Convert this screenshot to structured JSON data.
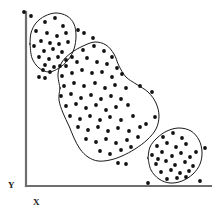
{
  "figure": {
    "title": "",
    "background_color": "#ffffff",
    "width": 217,
    "height": 213
  },
  "axes": {
    "x_label": "X",
    "y_label": "Y",
    "axis_color": "#6e6e6e",
    "origin_x": 26,
    "origin_y": 186,
    "x_axis_end": 211,
    "y_axis_top": 12
  },
  "style": {
    "point_color": "#111111",
    "point_radius": 1.9,
    "contour_color": "#1a1a1a",
    "contour_width": 1.0
  },
  "chart_data": {
    "type": "scatter",
    "title": "",
    "xlabel": "X",
    "ylabel": "Y",
    "xlim": [
      26,
      211
    ],
    "ylim": [
      12,
      186
    ],
    "grid": false,
    "legend": "none",
    "annotation": "Three point clusters enclosed by hand-drawn contours",
    "cluster_count": 3,
    "series": [
      {
        "name": "cluster-top-left",
        "shape": "circular-blob",
        "point_count": 25,
        "points": [
          [
            31,
            16
          ],
          [
            45,
            22
          ],
          [
            55,
            18
          ],
          [
            63,
            26
          ],
          [
            36,
            31
          ],
          [
            47,
            33
          ],
          [
            57,
            36
          ],
          [
            66,
            33
          ],
          [
            41,
            41
          ],
          [
            50,
            43
          ],
          [
            59,
            44
          ],
          [
            68,
            42
          ],
          [
            34,
            46
          ],
          [
            44,
            51
          ],
          [
            53,
            49
          ],
          [
            62,
            52
          ],
          [
            39,
            57
          ],
          [
            49,
            59
          ],
          [
            58,
            57
          ],
          [
            66,
            60
          ],
          [
            45,
            65
          ],
          [
            54,
            67
          ],
          [
            50,
            72
          ],
          [
            43,
            70
          ],
          [
            60,
            66
          ]
        ],
        "contour": [
          [
            30,
            44
          ],
          [
            31,
            33
          ],
          [
            36,
            23
          ],
          [
            45,
            16
          ],
          [
            56,
            13
          ],
          [
            67,
            16
          ],
          [
            74,
            24
          ],
          [
            76,
            36
          ],
          [
            74,
            49
          ],
          [
            68,
            60
          ],
          [
            59,
            68
          ],
          [
            49,
            72
          ],
          [
            39,
            68
          ],
          [
            32,
            58
          ],
          [
            30,
            44
          ]
        ],
        "outliers": [
          [
            24,
            12
          ],
          [
            78,
            30
          ],
          [
            84,
            33
          ],
          [
            39,
            77
          ],
          [
            45,
            78
          ]
        ]
      },
      {
        "name": "cluster-center",
        "shape": "peanut-kidney",
        "point_count": 63,
        "points": [
          [
            72,
            57
          ],
          [
            83,
            50
          ],
          [
            94,
            46
          ],
          [
            104,
            51
          ],
          [
            112,
            57
          ],
          [
            66,
            66
          ],
          [
            77,
            62
          ],
          [
            87,
            58
          ],
          [
            97,
            62
          ],
          [
            107,
            64
          ],
          [
            117,
            68
          ],
          [
            62,
            76
          ],
          [
            72,
            73
          ],
          [
            82,
            70
          ],
          [
            92,
            73
          ],
          [
            102,
            72
          ],
          [
            112,
            77
          ],
          [
            122,
            74
          ],
          [
            64,
            86
          ],
          [
            74,
            83
          ],
          [
            84,
            86
          ],
          [
            95,
            83
          ],
          [
            105,
            88
          ],
          [
            115,
            85
          ],
          [
            126,
            88
          ],
          [
            61,
            96
          ],
          [
            71,
            94
          ],
          [
            81,
            98
          ],
          [
            91,
            95
          ],
          [
            101,
            99
          ],
          [
            111,
            96
          ],
          [
            121,
            99
          ],
          [
            66,
            106
          ],
          [
            76,
            104
          ],
          [
            86,
            108
          ],
          [
            96,
            105
          ],
          [
            106,
            110
          ],
          [
            116,
            107
          ],
          [
            128,
            105
          ],
          [
            70,
            116
          ],
          [
            80,
            119
          ],
          [
            90,
            116
          ],
          [
            100,
            120
          ],
          [
            110,
            117
          ],
          [
            121,
            120
          ],
          [
            133,
            116
          ],
          [
            78,
            127
          ],
          [
            88,
            130
          ],
          [
            98,
            127
          ],
          [
            108,
            131
          ],
          [
            118,
            128
          ],
          [
            129,
            131
          ],
          [
            140,
            127
          ],
          [
            86,
            139
          ],
          [
            96,
            142
          ],
          [
            106,
            139
          ],
          [
            116,
            143
          ],
          [
            127,
            140
          ],
          [
            138,
            137
          ],
          [
            100,
            151
          ],
          [
            110,
            154
          ],
          [
            121,
            150
          ],
          [
            131,
            147
          ]
        ],
        "contour": [
          [
            60,
            88
          ],
          [
            58,
            74
          ],
          [
            62,
            62
          ],
          [
            71,
            53
          ],
          [
            83,
            46
          ],
          [
            95,
            42
          ],
          [
            106,
            45
          ],
          [
            114,
            54
          ],
          [
            119,
            66
          ],
          [
            126,
            77
          ],
          [
            136,
            84
          ],
          [
            148,
            92
          ],
          [
            156,
            103
          ],
          [
            159,
            116
          ],
          [
            156,
            129
          ],
          [
            147,
            140
          ],
          [
            135,
            149
          ],
          [
            122,
            156
          ],
          [
            110,
            160
          ],
          [
            98,
            161
          ],
          [
            88,
            157
          ],
          [
            80,
            149
          ],
          [
            74,
            138
          ],
          [
            69,
            126
          ],
          [
            63,
            113
          ],
          [
            59,
            100
          ],
          [
            60,
            88
          ]
        ],
        "outliers": [
          [
            93,
            38
          ],
          [
            140,
            86
          ],
          [
            152,
            92
          ],
          [
            155,
            117
          ],
          [
            118,
            163
          ],
          [
            126,
            164
          ]
        ]
      },
      {
        "name": "cluster-bottom-right",
        "shape": "oval",
        "point_count": 26,
        "points": [
          [
            163,
            137
          ],
          [
            173,
            133
          ],
          [
            182,
            138
          ],
          [
            157,
            146
          ],
          [
            167,
            143
          ],
          [
            176,
            147
          ],
          [
            186,
            144
          ],
          [
            152,
            155
          ],
          [
            162,
            152
          ],
          [
            172,
            156
          ],
          [
            181,
            153
          ],
          [
            190,
            157
          ],
          [
            156,
            164
          ],
          [
            166,
            161
          ],
          [
            175,
            165
          ],
          [
            185,
            162
          ],
          [
            193,
            166
          ],
          [
            161,
            172
          ],
          [
            171,
            170
          ],
          [
            180,
            173
          ],
          [
            189,
            171
          ],
          [
            167,
            179
          ],
          [
            177,
            178
          ],
          [
            186,
            177
          ],
          [
            158,
            159
          ],
          [
            196,
            152
          ]
        ],
        "contour": [
          [
            148,
            158
          ],
          [
            150,
            147
          ],
          [
            157,
            138
          ],
          [
            167,
            131
          ],
          [
            179,
            128
          ],
          [
            191,
            131
          ],
          [
            199,
            140
          ],
          [
            202,
            152
          ],
          [
            200,
            164
          ],
          [
            193,
            174
          ],
          [
            182,
            181
          ],
          [
            170,
            183
          ],
          [
            159,
            179
          ],
          [
            151,
            170
          ],
          [
            148,
            158
          ]
        ],
        "outliers": [
          [
            146,
            124
          ],
          [
            205,
            148
          ],
          [
            148,
            183
          ],
          [
            200,
            181
          ]
        ]
      }
    ]
  }
}
